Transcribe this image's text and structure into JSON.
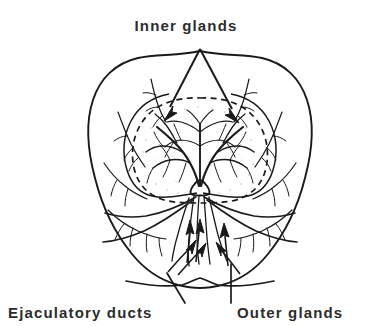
{
  "figure": {
    "title": "Prostate cross-section showing inner and outer glands",
    "type": "anatomical-line-drawing",
    "background_color": "#ffffff",
    "line_color": "#1a1a1a",
    "text_color": "#2c2c2c",
    "stipple_color": "#b8b0a8"
  },
  "labels": {
    "inner_glands": "Inner glands",
    "ejaculatory_ducts": "Ejaculatory ducts",
    "outer_glands": "Outer glands"
  },
  "annotations": [
    {
      "name": "inner-glands",
      "text": "Inner glands",
      "position": "top-center",
      "leader": "v-shaped double arrow pointing down-left and down-right into the dashed inner zone",
      "arrow_count": 2
    },
    {
      "name": "ejaculatory-ducts",
      "text": "Ejaculatory ducts",
      "position": "bottom-left",
      "leader": "single line rising up-right to the central arrow cluster",
      "arrow_count": 0
    },
    {
      "name": "outer-glands",
      "text": "Outer glands",
      "position": "bottom-right",
      "leader": "single near-vertical line rising to the right arrow cluster",
      "arrow_count": 0
    }
  ],
  "structures": [
    {
      "name": "outer-capsule",
      "description": "heart / spade shaped organ outline",
      "line_style": "solid"
    },
    {
      "name": "inner-gland-boundary",
      "description": "dashed ellipse separating inner glands from outer glands",
      "line_style": "dashed"
    },
    {
      "name": "inner-gland-duct-tree",
      "description": "bilateral branching duct tree radiating from central base",
      "line_style": "solid"
    },
    {
      "name": "outer-gland-ducts",
      "description": "fine branching ducts in the peripheral zone",
      "line_style": "solid"
    },
    {
      "name": "ejaculatory-duct-arrows",
      "description": "clusters of solid filled arrows pointing upward into the gland base",
      "arrow_count": 6
    }
  ]
}
